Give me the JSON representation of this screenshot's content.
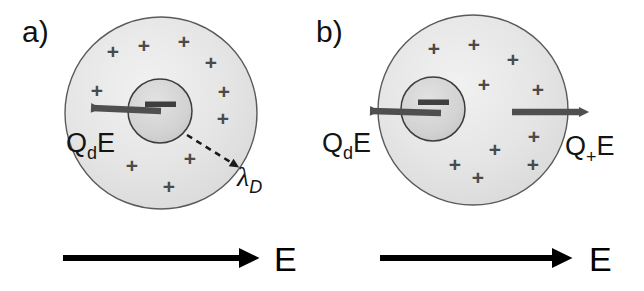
{
  "figure": {
    "width": 644,
    "height": 291,
    "background": "#ffffff"
  },
  "colors": {
    "shell_fill_outer": "#e3e3e3",
    "shell_fill_inner": "#f2f2f2",
    "shell_stroke": "#5a5a5a",
    "core_fill": "#d0d0d0",
    "core_stroke": "#3c3c3c",
    "charge_symbol": "#4a4a4a",
    "force_arrow": "#4f4f4f",
    "field_arrow": "#000000",
    "dashed_arrow": "#1a1a1a",
    "text": "#111111"
  },
  "panels": [
    {
      "id": "a",
      "label": "a)",
      "label_x": 22,
      "label_y": 42,
      "outer_circle": {
        "cx": 161,
        "cy": 113,
        "r": 96
      },
      "core_circle": {
        "cx": 160,
        "cy": 111,
        "r": 32
      },
      "core_sign": "minus",
      "positive_charges": [
        {
          "x": 113,
          "y": 51
        },
        {
          "x": 144,
          "y": 45
        },
        {
          "x": 184,
          "y": 41
        },
        {
          "x": 211,
          "y": 62
        },
        {
          "x": 97,
          "y": 90
        },
        {
          "x": 224,
          "y": 91
        },
        {
          "x": 223,
          "y": 118
        },
        {
          "x": 132,
          "y": 165
        },
        {
          "x": 190,
          "y": 158
        },
        {
          "x": 169,
          "y": 186
        }
      ],
      "force_arrow": {
        "name": "drag-force-arrow",
        "x1": 161,
        "y1": 111,
        "x2": 90,
        "y2": 108,
        "direction": "left"
      },
      "force_label": {
        "base": "Q",
        "subscript": "d",
        "suffix": "E",
        "x": 66,
        "y": 152
      },
      "debye_arrow": {
        "name": "debye-length-arrow",
        "x1": 187,
        "y1": 135,
        "x2": 234,
        "y2": 165,
        "style": "dashed"
      },
      "debye_label": {
        "base": "λ",
        "subscript": "D",
        "x": 237,
        "y": 186
      },
      "field_arrow": {
        "x1": 63,
        "y1": 258,
        "x2": 259,
        "y2": 258
      },
      "field_label": {
        "text": "E",
        "x": 274,
        "y": 271
      }
    },
    {
      "id": "b",
      "label": "b)",
      "label_x": 316,
      "label_y": 42,
      "outer_circle": {
        "cx": 473,
        "cy": 110,
        "r": 95
      },
      "core_circle": {
        "cx": 433,
        "cy": 109,
        "r": 32
      },
      "core_sign": "minus",
      "positive_charges": [
        {
          "x": 434,
          "y": 48
        },
        {
          "x": 474,
          "y": 44
        },
        {
          "x": 513,
          "y": 59
        },
        {
          "x": 484,
          "y": 84
        },
        {
          "x": 538,
          "y": 89
        },
        {
          "x": 534,
          "y": 136
        },
        {
          "x": 495,
          "y": 149
        },
        {
          "x": 533,
          "y": 164
        },
        {
          "x": 478,
          "y": 177
        },
        {
          "x": 455,
          "y": 164
        },
        {
          "x": 509,
          "y": 167
        }
      ],
      "force_arrow_left": {
        "name": "drag-force-arrow",
        "x1": 441,
        "y1": 113,
        "x2": 369,
        "y2": 111,
        "direction": "left"
      },
      "force_label_left": {
        "base": "Q",
        "subscript": "d",
        "suffix": "E",
        "x": 322,
        "y": 152
      },
      "force_arrow_right": {
        "name": "ion-force-arrow",
        "x1": 512,
        "y1": 112,
        "x2": 582,
        "y2": 112,
        "direction": "right"
      },
      "force_label_right": {
        "base": "Q",
        "subscript": "+",
        "suffix": "E",
        "x": 565,
        "y": 155
      },
      "field_arrow": {
        "x1": 380,
        "y1": 258,
        "x2": 572,
        "y2": 258
      },
      "field_label": {
        "text": "E",
        "x": 589,
        "y": 271
      }
    }
  ],
  "legend": {
    "plus_symbol": "+",
    "minus_symbol": "−"
  }
}
